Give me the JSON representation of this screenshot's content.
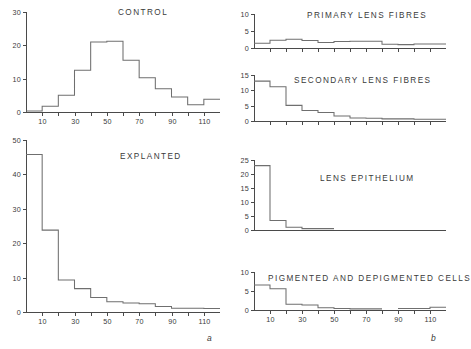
{
  "figure": {
    "panel_a_letter": "a",
    "panel_b_letter": "b"
  },
  "chart_data": [
    {
      "type": "area",
      "id": "control",
      "title": "CONTROL",
      "panel": "a",
      "xlabel": "",
      "ylabel": "",
      "xlim": [
        0,
        120
      ],
      "ylim": [
        0,
        30
      ],
      "yticks": [
        0,
        10,
        20,
        30
      ],
      "ytick_labels": [
        "0",
        "10",
        "20",
        "30"
      ],
      "xticks": [
        10,
        20,
        30,
        40,
        50,
        60,
        70,
        80,
        90,
        100,
        110
      ],
      "xtick_labels": [
        "10",
        "",
        "30",
        "",
        "50",
        "",
        "70",
        "",
        "90",
        "",
        "110"
      ],
      "grid": false,
      "bin_width": 10,
      "bin_starts": [
        0,
        10,
        20,
        30,
        40,
        50,
        60,
        70,
        80,
        90,
        100,
        110
      ],
      "values": [
        0.3,
        1.7,
        5,
        12.5,
        21,
        21.2,
        15.5,
        10.3,
        7,
        4.5,
        2.2,
        3.8
      ]
    },
    {
      "type": "area",
      "id": "explanted",
      "title": "EXPLANTED",
      "panel": "a",
      "xlabel": "",
      "ylabel": "",
      "xlim": [
        0,
        120
      ],
      "ylim": [
        0,
        50
      ],
      "yticks": [
        0,
        10,
        20,
        30,
        40,
        50
      ],
      "ytick_labels": [
        "0",
        "10",
        "20",
        "30",
        "40",
        "50"
      ],
      "xticks": [
        10,
        20,
        30,
        40,
        50,
        60,
        70,
        80,
        90,
        100,
        110
      ],
      "xtick_labels": [
        "10",
        "",
        "30",
        "",
        "50",
        "",
        "70",
        "",
        "90",
        "",
        "110"
      ],
      "grid": false,
      "bin_width": 10,
      "bin_starts": [
        0,
        10,
        20,
        30,
        40,
        50,
        60,
        70,
        80,
        90,
        100,
        110
      ],
      "values": [
        45.8,
        23.8,
        9.3,
        6.8,
        4.2,
        3.0,
        2.6,
        2.4,
        1.6,
        1.1,
        1.1,
        1.0
      ]
    },
    {
      "type": "area",
      "id": "primary-lens-fibres",
      "title": "PRIMARY  LENS  FIBRES",
      "panel": "b",
      "xlabel": "",
      "ylabel": "",
      "xlim": [
        0,
        120
      ],
      "ylim": [
        0,
        10
      ],
      "yticks": [
        0,
        5,
        10
      ],
      "ytick_labels": [
        "0",
        "5",
        "10"
      ],
      "xticks": [
        10,
        20,
        30,
        40,
        50,
        60,
        70,
        80,
        90,
        100,
        110
      ],
      "xtick_labels": [
        "",
        "",
        "",
        "",
        "",
        "",
        "",
        "",
        "",
        "",
        ""
      ],
      "grid": false,
      "bin_width": 10,
      "bin_starts": [
        0,
        10,
        20,
        30,
        40,
        50,
        60,
        70,
        80,
        90,
        100,
        110
      ],
      "values": [
        1.4,
        2.3,
        2.6,
        2.2,
        1.6,
        1.9,
        2.0,
        2.0,
        1.1,
        1.0,
        1.2,
        1.2
      ]
    },
    {
      "type": "area",
      "id": "secondary-lens-fibres",
      "title": "SECONDARY  LENS  FIBRES",
      "panel": "b",
      "xlabel": "",
      "ylabel": "",
      "xlim": [
        0,
        120
      ],
      "ylim": [
        0,
        15
      ],
      "yticks": [
        0,
        5,
        10,
        15
      ],
      "ytick_labels": [
        "0",
        "5",
        "10",
        "15"
      ],
      "xticks": [
        10,
        20,
        30,
        40,
        50,
        60,
        70,
        80,
        90,
        100,
        110
      ],
      "xtick_labels": [
        "",
        "",
        "",
        "",
        "",
        "",
        "",
        "",
        "",
        "",
        ""
      ],
      "grid": false,
      "bin_width": 10,
      "bin_starts": [
        0,
        10,
        20,
        30,
        40,
        50,
        60,
        70,
        80,
        90,
        100,
        110
      ],
      "values": [
        13.0,
        11.2,
        5.1,
        3.4,
        2.8,
        1.6,
        1.0,
        0.9,
        0.7,
        0.7,
        0.6,
        0.6
      ]
    },
    {
      "type": "area",
      "id": "lens-epithelium",
      "title": "LENS  EPITHELIUM",
      "panel": "b",
      "xlabel": "",
      "ylabel": "",
      "xlim": [
        0,
        120
      ],
      "ylim": [
        0,
        25
      ],
      "yticks": [
        0,
        5,
        10,
        15,
        20,
        25
      ],
      "ytick_labels": [
        "0",
        "5",
        "10",
        "15",
        "20",
        "25"
      ],
      "grid": false,
      "bin_width": 10,
      "bin_starts": [
        0,
        10,
        20,
        30,
        40
      ],
      "values": [
        23.0,
        3.4,
        1.0,
        0.5,
        0.5
      ],
      "note": "series ends after x=50; no data plotted beyond"
    },
    {
      "type": "area",
      "id": "pigmented-and-depigmented-cells",
      "title": "PIGMENTED  AND  DEPIGMENTED  CELLS",
      "panel": "b",
      "xlabel": "",
      "ylabel": "",
      "xlim": [
        0,
        120
      ],
      "ylim": [
        0,
        10
      ],
      "yticks": [
        0,
        5,
        10
      ],
      "ytick_labels": [
        "0",
        "5",
        "10"
      ],
      "xticks": [
        10,
        20,
        30,
        40,
        50,
        60,
        70,
        80,
        90,
        100,
        110
      ],
      "xtick_labels": [
        "10",
        "",
        "30",
        "",
        "50",
        "",
        "70",
        "",
        "90",
        "",
        "110"
      ],
      "grid": false,
      "bin_width": 10,
      "bin_starts": [
        0,
        10,
        20,
        30,
        40,
        50,
        60,
        70,
        90,
        100,
        110
      ],
      "values": [
        6.6,
        5.6,
        1.5,
        1.3,
        0.6,
        0.4,
        0.3,
        0.3,
        0.4,
        0.4,
        0.7
      ],
      "gaps": [
        80,
        120
      ]
    }
  ]
}
